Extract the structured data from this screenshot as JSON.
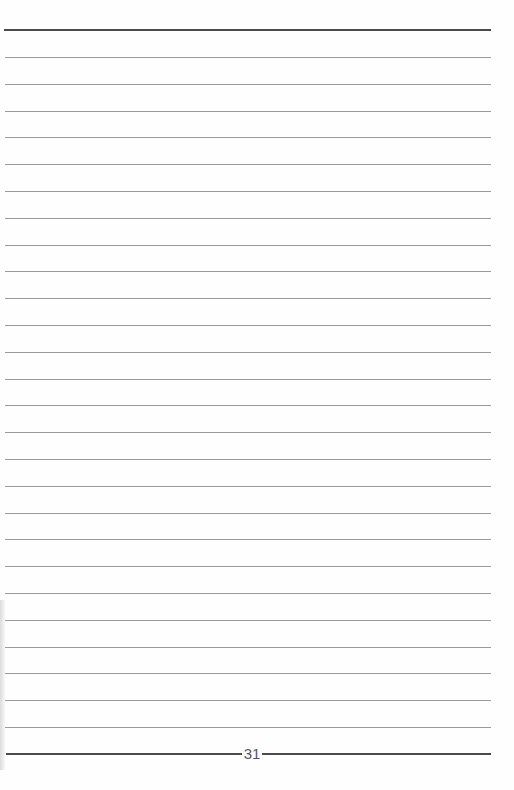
{
  "page": {
    "page_number": "31",
    "line_count": 26,
    "line_start_y": 57,
    "line_spacing": 26.8,
    "top_rule_y": 29,
    "colors": {
      "thick_rule": "#4a4a4a",
      "thin_rule": "#9a9a9a",
      "page_number": "#555555"
    }
  }
}
